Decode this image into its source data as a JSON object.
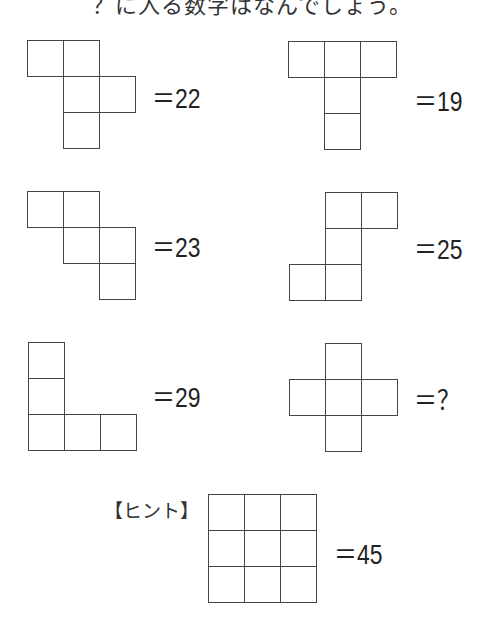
{
  "title": "？に入る数字はなんでしょう。",
  "cell_size": 37,
  "puzzles": [
    {
      "id": "shape-1",
      "origin": [
        27,
        40
      ],
      "cells": [
        [
          0,
          0
        ],
        [
          1,
          0
        ],
        [
          1,
          1
        ],
        [
          2,
          1
        ],
        [
          1,
          2
        ]
      ],
      "label": "＝22",
      "label_pos": [
        152,
        86
      ]
    },
    {
      "id": "shape-2",
      "origin": [
        288,
        41
      ],
      "cells": [
        [
          0,
          0
        ],
        [
          1,
          0
        ],
        [
          2,
          0
        ],
        [
          1,
          1
        ],
        [
          1,
          2
        ]
      ],
      "label": "＝19",
      "label_pos": [
        414,
        89
      ]
    },
    {
      "id": "shape-3",
      "origin": [
        27,
        191
      ],
      "cells": [
        [
          0,
          0
        ],
        [
          1,
          0
        ],
        [
          1,
          1
        ],
        [
          2,
          1
        ],
        [
          2,
          2
        ]
      ],
      "label": "＝23",
      "label_pos": [
        152,
        235
      ]
    },
    {
      "id": "shape-4",
      "origin": [
        289,
        192
      ],
      "cells": [
        [
          1,
          0
        ],
        [
          2,
          0
        ],
        [
          1,
          1
        ],
        [
          0,
          2
        ],
        [
          1,
          2
        ]
      ],
      "label": "＝25",
      "label_pos": [
        414,
        237
      ]
    },
    {
      "id": "shape-5",
      "origin": [
        28,
        342
      ],
      "cells": [
        [
          0,
          0
        ],
        [
          0,
          1
        ],
        [
          0,
          2
        ],
        [
          1,
          2
        ],
        [
          2,
          2
        ]
      ],
      "label": "＝29",
      "label_pos": [
        152,
        385
      ]
    },
    {
      "id": "shape-6",
      "origin": [
        289,
        343
      ],
      "cells": [
        [
          1,
          0
        ],
        [
          0,
          1
        ],
        [
          1,
          1
        ],
        [
          2,
          1
        ],
        [
          1,
          2
        ]
      ],
      "label": "＝？",
      "label_pos": [
        414,
        388
      ]
    }
  ],
  "hint": {
    "label": "【ヒント】",
    "label_pos": [
      104,
      496
    ],
    "origin": [
      208,
      494
    ],
    "cells": [
      [
        0,
        0
      ],
      [
        1,
        0
      ],
      [
        2,
        0
      ],
      [
        0,
        1
      ],
      [
        1,
        1
      ],
      [
        2,
        1
      ],
      [
        0,
        2
      ],
      [
        1,
        2
      ],
      [
        2,
        2
      ]
    ],
    "value": "＝45",
    "value_pos": [
      334,
      542
    ]
  }
}
